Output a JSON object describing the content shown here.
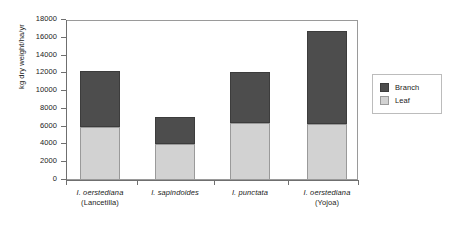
{
  "chart_data": {
    "type": "bar",
    "subtype": "stacked-vertical",
    "title": "",
    "xlabel": "",
    "ylabel": "kg dry weight/ha/yr",
    "ylim": [
      0,
      18000
    ],
    "ytick_step": 2000,
    "yticks": [
      "18000",
      "16000",
      "14000",
      "12000",
      "10000",
      "8000",
      "6000",
      "4000",
      "2000",
      "0"
    ],
    "grid": false,
    "legend_position": "right",
    "categories": [
      {
        "italic": "I. oerstediana",
        "plain": "(Lancetilla)"
      },
      {
        "italic": "I. sapindoides",
        "plain": ""
      },
      {
        "italic": "I. punctata",
        "plain": ""
      },
      {
        "italic": "I. oerstediana",
        "plain": "(Yojoa)"
      }
    ],
    "category_labels": [
      "I. oerstediana (Lancetilla)",
      "I. sapindoides",
      "I. punctata",
      "I. oerstediana (Yojoa)"
    ],
    "series": [
      {
        "name": "Leaf",
        "color": "#d2d2d2",
        "values": [
          6000,
          4100,
          6400,
          6300
        ]
      },
      {
        "name": "Branch",
        "color": "#4d4d4d",
        "values": [
          6300,
          3000,
          5800,
          10500
        ]
      }
    ],
    "totals": [
      12300,
      7100,
      12200,
      16800
    ]
  },
  "legend": {
    "items": [
      {
        "label": "Branch",
        "color": "#4d4d4d"
      },
      {
        "label": "Leaf",
        "color": "#d2d2d2"
      }
    ]
  },
  "colors": {
    "branch": "#4d4d4d",
    "leaf": "#d2d2d2",
    "axis": "#6f6f6f",
    "frame": "#9a9a9a",
    "background": "#ffffff"
  }
}
